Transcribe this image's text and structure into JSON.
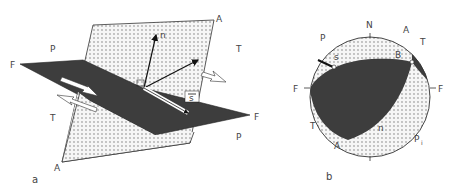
{
  "figure": {
    "colors": {
      "fault_plane": "#3d3d3d",
      "auxiliary_plane": "#f4f4f4",
      "stipple": "#6a6a6a",
      "outline": "#333333",
      "background": "#ffffff"
    },
    "panel_a": {
      "caption": "a",
      "labels": {
        "aux_top": "A",
        "aux_bottom": "A",
        "fault_left": "F",
        "fault_right": "F",
        "normal": "n",
        "slip": "s",
        "p_top_left": "P",
        "t_top_right": "T",
        "t_bottom_left": "T",
        "p_bottom_right": "P"
      }
    },
    "panel_b": {
      "caption": "b",
      "labels": {
        "north": "N",
        "a_top": "A",
        "t_top_right": "T",
        "p_top_left": "P",
        "slip": "s",
        "b_axis": "B",
        "f_left": "F",
        "f_right": "F",
        "t_left": "T",
        "a_bottom": "A",
        "normal": "n",
        "p_bottom_right": "P",
        "p_subscript": "i"
      }
    }
  }
}
